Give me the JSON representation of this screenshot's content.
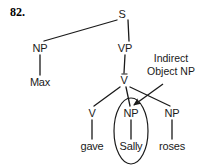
{
  "figure": {
    "item_number": "82.",
    "type": "syntax-tree",
    "bg_color": "#ffffff",
    "ink_color": "#1a1a1a"
  },
  "tree": {
    "nodes": [
      {
        "id": "s",
        "label": "S",
        "x": 122,
        "y": 14,
        "overbar": false
      },
      {
        "id": "np1",
        "label": "NP",
        "x": 40,
        "y": 48,
        "overbar": false
      },
      {
        "id": "vp",
        "label": "VP",
        "x": 125,
        "y": 48,
        "overbar": false
      },
      {
        "id": "max",
        "label": "Max",
        "x": 40,
        "y": 82,
        "overbar": false
      },
      {
        "id": "vbar",
        "label": "V",
        "x": 124,
        "y": 80,
        "overbar": true
      },
      {
        "id": "v",
        "label": "V",
        "x": 92,
        "y": 113,
        "overbar": false
      },
      {
        "id": "np2",
        "label": "NP",
        "x": 131,
        "y": 113,
        "overbar": false
      },
      {
        "id": "np3",
        "label": "NP",
        "x": 172,
        "y": 113,
        "overbar": false
      },
      {
        "id": "gave",
        "label": "gave",
        "x": 92,
        "y": 146,
        "overbar": false
      },
      {
        "id": "sally",
        "label": "Sally",
        "x": 131,
        "y": 146,
        "overbar": false
      },
      {
        "id": "roses",
        "label": "roses",
        "x": 172,
        "y": 146,
        "overbar": false
      }
    ],
    "edges": [
      {
        "from": "s",
        "to": "np1",
        "x1": 117,
        "y1": 20,
        "x2": 44,
        "y2": 41
      },
      {
        "from": "s",
        "to": "vp",
        "x1": 128,
        "y1": 20,
        "x2": 129,
        "y2": 41
      },
      {
        "from": "np1",
        "to": "max",
        "x1": 40,
        "y1": 55,
        "x2": 40,
        "y2": 75
      },
      {
        "from": "vp",
        "to": "vbar",
        "x1": 125,
        "y1": 55,
        "x2": 124,
        "y2": 73
      },
      {
        "from": "vbar",
        "to": "v",
        "x1": 120,
        "y1": 87,
        "x2": 94,
        "y2": 106
      },
      {
        "from": "vbar",
        "to": "np2",
        "x1": 126,
        "y1": 87,
        "x2": 130,
        "y2": 106
      },
      {
        "from": "vbar",
        "to": "np3",
        "x1": 130,
        "y1": 87,
        "x2": 170,
        "y2": 106
      },
      {
        "from": "v",
        "to": "gave",
        "x1": 92,
        "y1": 120,
        "x2": 92,
        "y2": 139
      },
      {
        "from": "np2",
        "to": "sally",
        "x1": 131,
        "y1": 120,
        "x2": 131,
        "y2": 139
      },
      {
        "from": "np3",
        "to": "roses",
        "x1": 172,
        "y1": 120,
        "x2": 172,
        "y2": 139
      }
    ]
  },
  "highlight": {
    "name": "circled-constituent",
    "shape": "ellipse",
    "cx": 131,
    "cy": 131,
    "rx": 17,
    "ry": 33,
    "encircles": "NP Sally"
  },
  "annotation": {
    "line1": "Indirect",
    "line2": "Object NP",
    "x": 171,
    "y": 59,
    "arrow": {
      "x1": 163,
      "y1": 84,
      "x2": 134,
      "y2": 105
    }
  }
}
